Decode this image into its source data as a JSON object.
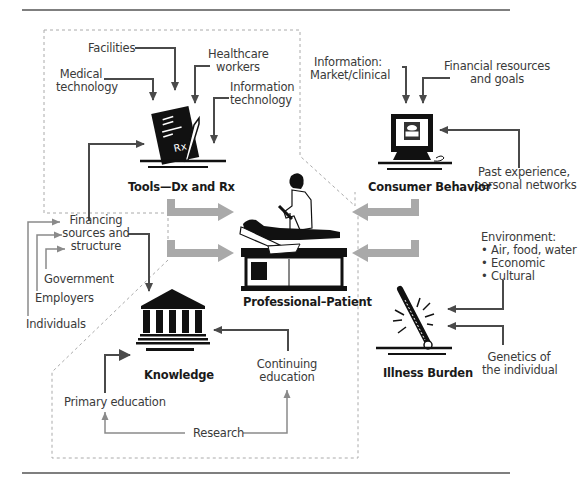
{
  "diagram": {
    "nodes": {
      "tools": {
        "title": "Tools—Dx and Rx",
        "icon": "prescription-pad-icon"
      },
      "consumer": {
        "title": "Consumer Behavior",
        "icon": "computer-icon"
      },
      "professional_patient": {
        "title": "Professional–Patient",
        "icon": "doctor-patient-icon"
      },
      "knowledge": {
        "title": "Knowledge",
        "icon": "institution-building-icon"
      },
      "illness": {
        "title": "Illness Burden",
        "icon": "thermometer-icon"
      }
    },
    "tools_inputs": {
      "facilities": "Facilities",
      "medical_technology_1": "Medical",
      "medical_technology_2": "technology",
      "healthcare_workers_1": "Healthcare",
      "healthcare_workers_2": "workers",
      "information_technology_1": "Information",
      "information_technology_2": "technology"
    },
    "consumer_inputs": {
      "information_1": "Information:",
      "information_2": "Market/clinical",
      "financial_1": "Financial resources",
      "financial_2": "and goals",
      "past_1": "Past experience,",
      "past_2": "personal networks"
    },
    "financing": {
      "label_1": "Financing",
      "label_2": "sources and",
      "label_3": "structure",
      "government": "Government",
      "employers": "Employers",
      "individuals": "Individuals"
    },
    "knowledge_inputs": {
      "continuing_1": "Continuing",
      "continuing_2": "education",
      "primary": "Primary education",
      "research": "Research"
    },
    "illness_inputs": {
      "environment_title": "Environment:",
      "environment_items": [
        "• Air, food, water",
        "• Economic",
        "• Cultural"
      ],
      "genetics_1": "Genetics of",
      "genetics_2": "the individual"
    },
    "colors": {
      "dark_arrow": "#4a4a4a",
      "light_arrow": "#8a8a8a",
      "block_arrow": "#a9a9a9",
      "dashed_border": "#aaaaaa",
      "rule": "#555555"
    }
  }
}
